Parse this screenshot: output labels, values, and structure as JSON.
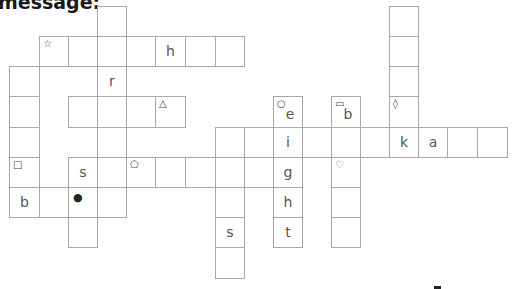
{
  "heading": "message:",
  "grid": {
    "cell_size": 29,
    "col_x": [
      9,
      39,
      68,
      97,
      126,
      155,
      185,
      215,
      244,
      273,
      302,
      331,
      360,
      389,
      418,
      447,
      477
    ],
    "row_y": [
      6,
      36,
      66,
      96,
      127,
      157,
      187,
      217,
      247
    ],
    "border_color": "#a8a8a8",
    "letter_color": "#555555"
  },
  "cells": [
    {
      "c": 3,
      "r": 0,
      "letter": "",
      "symbol": ""
    },
    {
      "c": 13,
      "r": 0,
      "letter": "",
      "symbol": ""
    },
    {
      "c": 1,
      "r": 1,
      "letter": "",
      "symbol": "☆",
      "symbol_name": "star"
    },
    {
      "c": 2,
      "r": 1,
      "letter": "",
      "symbol": ""
    },
    {
      "c": 3,
      "r": 1,
      "letter": "",
      "symbol": ""
    },
    {
      "c": 4,
      "r": 1,
      "letter": "",
      "symbol": ""
    },
    {
      "c": 5,
      "r": 1,
      "letter": "h",
      "symbol": ""
    },
    {
      "c": 6,
      "r": 1,
      "letter": "",
      "symbol": ""
    },
    {
      "c": 7,
      "r": 1,
      "letter": "",
      "symbol": ""
    },
    {
      "c": 13,
      "r": 1,
      "letter": "",
      "symbol": ""
    },
    {
      "c": 0,
      "r": 2,
      "letter": "",
      "symbol": ""
    },
    {
      "c": 3,
      "r": 2,
      "letter": "r",
      "symbol": ""
    },
    {
      "c": 13,
      "r": 2,
      "letter": "",
      "symbol": ""
    },
    {
      "c": 0,
      "r": 3,
      "letter": "",
      "symbol": ""
    },
    {
      "c": 2,
      "r": 3,
      "letter": "",
      "symbol": ""
    },
    {
      "c": 3,
      "r": 3,
      "letter": "",
      "symbol": ""
    },
    {
      "c": 4,
      "r": 3,
      "letter": "",
      "symbol": ""
    },
    {
      "c": 5,
      "r": 3,
      "letter": "",
      "symbol": "△",
      "symbol_name": "triangle"
    },
    {
      "c": 9,
      "r": 3,
      "letter": "e",
      "symbol": "○",
      "symbol_name": "circle",
      "low": true
    },
    {
      "c": 11,
      "r": 3,
      "letter": "b",
      "symbol": "▭",
      "symbol_name": "rectangle",
      "low": true
    },
    {
      "c": 13,
      "r": 3,
      "letter": "",
      "symbol": "◊",
      "symbol_name": "diamond"
    },
    {
      "c": 0,
      "r": 4,
      "letter": "",
      "symbol": ""
    },
    {
      "c": 3,
      "r": 4,
      "letter": "",
      "symbol": ""
    },
    {
      "c": 7,
      "r": 4,
      "letter": "",
      "symbol": ""
    },
    {
      "c": 8,
      "r": 4,
      "letter": "",
      "symbol": ""
    },
    {
      "c": 9,
      "r": 4,
      "letter": "i",
      "symbol": ""
    },
    {
      "c": 10,
      "r": 4,
      "letter": "",
      "symbol": ""
    },
    {
      "c": 11,
      "r": 4,
      "letter": "",
      "symbol": ""
    },
    {
      "c": 12,
      "r": 4,
      "letter": "",
      "symbol": ""
    },
    {
      "c": 13,
      "r": 4,
      "letter": "k",
      "symbol": ""
    },
    {
      "c": 14,
      "r": 4,
      "letter": "a",
      "symbol": ""
    },
    {
      "c": 15,
      "r": 4,
      "letter": "",
      "symbol": ""
    },
    {
      "c": 16,
      "r": 4,
      "letter": "",
      "symbol": ""
    },
    {
      "c": 0,
      "r": 5,
      "letter": "",
      "symbol": "□",
      "symbol_name": "square"
    },
    {
      "c": 2,
      "r": 5,
      "letter": "s",
      "symbol": ""
    },
    {
      "c": 3,
      "r": 5,
      "letter": "",
      "symbol": ""
    },
    {
      "c": 4,
      "r": 5,
      "letter": "",
      "symbol": "⬠",
      "symbol_name": "pentagon"
    },
    {
      "c": 5,
      "r": 5,
      "letter": "",
      "symbol": ""
    },
    {
      "c": 6,
      "r": 5,
      "letter": "",
      "symbol": ""
    },
    {
      "c": 7,
      "r": 5,
      "letter": "",
      "symbol": ""
    },
    {
      "c": 8,
      "r": 5,
      "letter": "",
      "symbol": ""
    },
    {
      "c": 9,
      "r": 5,
      "letter": "g",
      "symbol": ""
    },
    {
      "c": 11,
      "r": 5,
      "letter": "",
      "symbol": "♡",
      "symbol_name": "heart"
    },
    {
      "c": 0,
      "r": 6,
      "letter": "b",
      "symbol": ""
    },
    {
      "c": 1,
      "r": 6,
      "letter": "",
      "symbol": ""
    },
    {
      "c": 2,
      "r": 6,
      "letter": "",
      "symbol": "●",
      "symbol_name": "dot"
    },
    {
      "c": 3,
      "r": 6,
      "letter": "",
      "symbol": ""
    },
    {
      "c": 7,
      "r": 6,
      "letter": "",
      "symbol": ""
    },
    {
      "c": 9,
      "r": 6,
      "letter": "h",
      "symbol": ""
    },
    {
      "c": 11,
      "r": 6,
      "letter": "",
      "symbol": ""
    },
    {
      "c": 2,
      "r": 7,
      "letter": "",
      "symbol": ""
    },
    {
      "c": 7,
      "r": 7,
      "letter": "s",
      "symbol": ""
    },
    {
      "c": 9,
      "r": 7,
      "letter": "t",
      "symbol": ""
    },
    {
      "c": 11,
      "r": 7,
      "letter": "",
      "symbol": ""
    },
    {
      "c": 7,
      "r": 8,
      "letter": "",
      "symbol": ""
    }
  ]
}
